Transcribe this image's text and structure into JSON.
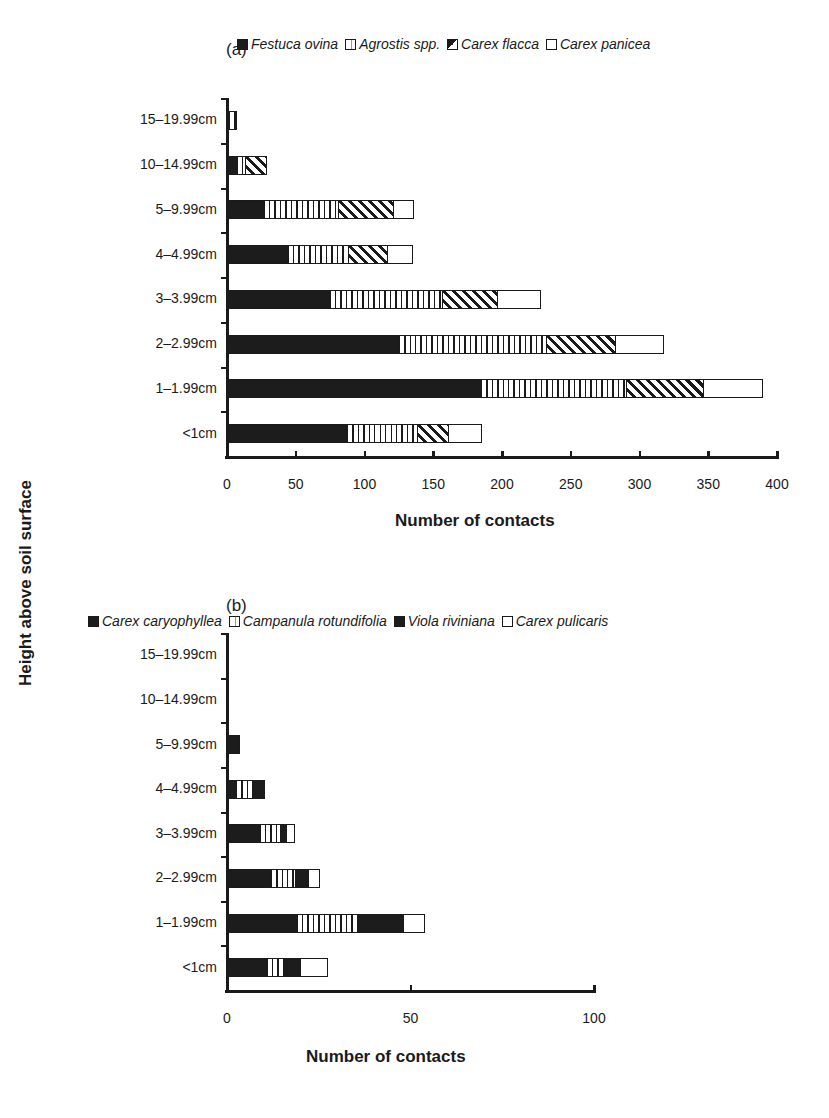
{
  "chart_data": [
    {
      "type": "bar",
      "orientation": "horizontal",
      "stacked": true,
      "panel": "(a)",
      "title": "",
      "xlabel": "Number of contacts",
      "ylabel": "Height above soil surface",
      "xlim": [
        0,
        400
      ],
      "xticks": [
        "0",
        "50",
        "100",
        "150",
        "200",
        "250",
        "300",
        "350",
        "400"
      ],
      "categories": [
        "15–19.99cm",
        "10–14.99cm",
        "5–9.99cm",
        "4–4.99cm",
        "3–3.99cm",
        "2–2.99cm",
        "1–1.99cm",
        "<1cm"
      ],
      "legend": [
        "Festuca ovina",
        "Agrostis spp.",
        "Carex flacca",
        "Carex panicea"
      ],
      "series": [
        {
          "name": "Festuca ovina",
          "pattern": "solid",
          "values": [
            1.5,
            7,
            27,
            44,
            75,
            125,
            185,
            87
          ]
        },
        {
          "name": "Agrostis spp.",
          "pattern": "vertical-stripes",
          "values": [
            4.5,
            6,
            54,
            44,
            81,
            107,
            105,
            51
          ]
        },
        {
          "name": "Carex flacca",
          "pattern": "diagonal-hatch",
          "values": [
            0,
            15,
            40,
            28,
            40,
            50,
            56,
            23
          ]
        },
        {
          "name": "Carex panicea",
          "pattern": "open",
          "values": [
            0,
            0,
            14,
            18,
            31,
            35,
            43,
            23
          ]
        }
      ],
      "grid": false,
      "legend_position": "top"
    },
    {
      "type": "bar",
      "orientation": "horizontal",
      "stacked": true,
      "panel": "(b)",
      "title": "",
      "xlabel": "Number of contacts",
      "ylabel": "Height above soil surface",
      "xlim": [
        0,
        100
      ],
      "xticks": [
        "0",
        "50",
        "100"
      ],
      "categories": [
        "15–19.99cm",
        "10–14.99cm",
        "5–9.99cm",
        "4–4.99cm",
        "3–3.99cm",
        "2–2.99cm",
        "1–1.99cm",
        "<1cm"
      ],
      "legend": [
        "Carex caryophyllea",
        "Campanula rotundifolia",
        "Viola riviniana",
        "Carex pulicaris"
      ],
      "series": [
        {
          "name": "Carex caryophyllea",
          "pattern": "solid",
          "values": [
            0,
            0,
            3,
            2.5,
            9,
            12,
            19,
            11
          ]
        },
        {
          "name": "Campanula rotundifolia",
          "pattern": "vertical-stripes",
          "values": [
            0,
            0,
            0,
            4.5,
            5.5,
            6.5,
            16.5,
            4.5
          ]
        },
        {
          "name": "Viola riviniana",
          "pattern": "solid",
          "values": [
            0,
            0,
            0,
            3,
            1.5,
            3.5,
            12.5,
            4.5
          ]
        },
        {
          "name": "Carex pulicaris",
          "pattern": "open",
          "values": [
            0,
            0,
            0,
            0,
            2,
            3,
            5.5,
            7
          ]
        }
      ],
      "grid": false,
      "legend_position": "top"
    }
  ],
  "panels": {
    "a": {
      "label": "(a)",
      "xlabel": "Number of contacts"
    },
    "b": {
      "label": "(b)",
      "xlabel": "Number of contacts"
    }
  },
  "ylabel": "Height above soil surface"
}
